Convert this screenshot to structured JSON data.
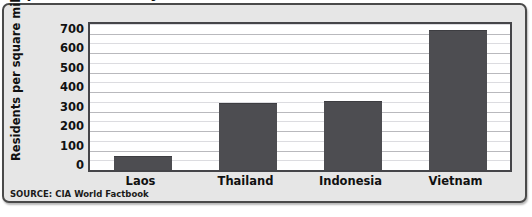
{
  "chart_data": {
    "type": "bar",
    "title": "Population Density of Selected Countries, 2014",
    "xlabel": "",
    "ylabel": "Residents per square mile",
    "categories": [
      "Laos",
      "Thailand",
      "Indonesia",
      "Vietnam"
    ],
    "values": [
      68,
      340,
      348,
      712
    ],
    "ylim": [
      0,
      750
    ],
    "yticks": [
      700,
      600,
      500,
      400,
      300,
      200,
      100,
      0
    ],
    "ytick_labels": [
      "700",
      "600",
      "500",
      "400",
      "300",
      "200",
      "100",
      "0"
    ],
    "minor_tick_interval": 50,
    "grid": true,
    "legend": "none",
    "series": [
      {
        "name": "Residents per square mile",
        "values": [
          68,
          340,
          348,
          712
        ],
        "color": "#4d4d51"
      }
    ],
    "annotations": {
      "source": "SOURCE: CIA World Factbook"
    }
  },
  "colors": {
    "bar_fill": "#4d4d51",
    "frame_background": "#e6e6e6",
    "frame_border": "#4a4a4a",
    "plot_background": "#ffffff",
    "plot_border": "#454549",
    "gridline_major": "#b9b9bd",
    "gridline_minor": "#dcdce0",
    "text": "#111111"
  }
}
